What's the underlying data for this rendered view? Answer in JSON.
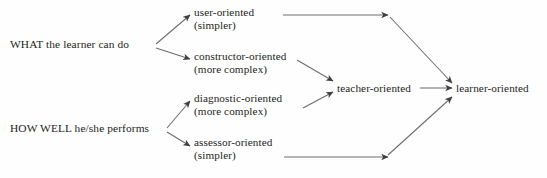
{
  "diagram": {
    "type": "flow-diagram",
    "background_color": "#fefefe",
    "text_color": "#231f20",
    "arrow_color": "#58595b",
    "sources": [
      {
        "id": "what",
        "label": "WHAT the learner can do"
      },
      {
        "id": "howwell",
        "label": "HOW WELL he/she performs"
      }
    ],
    "middle": [
      {
        "id": "user",
        "line1": "user-oriented",
        "line2": "(simpler)"
      },
      {
        "id": "constructor",
        "line1": "constructor-oriented",
        "line2": "(more complex)"
      },
      {
        "id": "diagnostic",
        "line1": "diagnostic-oriented",
        "line2": "(more complex)"
      },
      {
        "id": "assessor",
        "line1": "assessor-oriented",
        "line2": "(simpler)"
      }
    ],
    "teacher": {
      "id": "teacher",
      "label": "teacher-oriented"
    },
    "learner": {
      "id": "learner",
      "label": "learner-oriented"
    },
    "edges": [
      {
        "from": "what",
        "to": "user"
      },
      {
        "from": "what",
        "to": "constructor"
      },
      {
        "from": "howwell",
        "to": "diagnostic"
      },
      {
        "from": "howwell",
        "to": "assessor"
      },
      {
        "from": "user",
        "to": "learner"
      },
      {
        "from": "constructor",
        "to": "teacher"
      },
      {
        "from": "diagnostic",
        "to": "teacher"
      },
      {
        "from": "teacher",
        "to": "learner"
      },
      {
        "from": "assessor",
        "to": "learner"
      }
    ]
  }
}
